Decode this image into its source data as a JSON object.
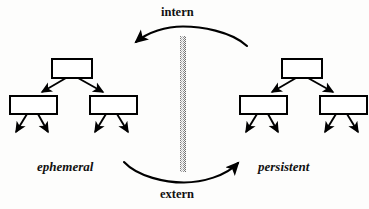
{
  "diagram": {
    "type": "concept-diagram",
    "title": "",
    "background_color": "#fdfdfc",
    "stroke_color": "#000000",
    "box_fill": "#ffffff",
    "barrier_color": "#8a8a8a",
    "labels": {
      "top_operation": "intern",
      "bottom_operation": "extern",
      "left_state": "ephemeral",
      "right_state": "persistent"
    },
    "left_tree": {
      "name": "ephemeral",
      "root": {
        "x": 52,
        "y": 59,
        "w": 40,
        "h": 19
      },
      "children": [
        {
          "x": 10,
          "y": 96,
          "w": 47,
          "h": 18
        },
        {
          "x": 90,
          "y": 96,
          "w": 47,
          "h": 18
        }
      ],
      "leaf_arrow_count": 4
    },
    "right_tree": {
      "name": "persistent",
      "root": {
        "x": 282,
        "y": 59,
        "w": 40,
        "h": 19
      },
      "children": [
        {
          "x": 240,
          "y": 96,
          "w": 47,
          "h": 18
        },
        {
          "x": 320,
          "y": 96,
          "w": 47,
          "h": 18
        }
      ],
      "leaf_arrow_count": 4
    },
    "barrier": {
      "x": 180,
      "y": 36,
      "w": 6,
      "h": 136
    },
    "arrows": [
      {
        "name": "intern-arc",
        "direction": "right-to-left",
        "label": "intern"
      },
      {
        "name": "extern-arc",
        "direction": "left-to-right",
        "label": "extern"
      }
    ]
  }
}
